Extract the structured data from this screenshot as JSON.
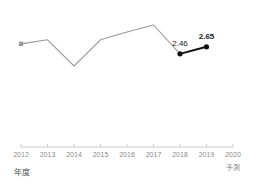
{
  "chart_data": {
    "type": "line",
    "title": "",
    "xlabel": "年度",
    "ylabel": "",
    "categories": [
      "2012",
      "2013",
      "2014",
      "2015",
      "2016",
      "2017",
      "2018",
      "2019",
      "2020"
    ],
    "series": [
      {
        "name": "actual",
        "color": "#9a9a9a",
        "values": [
          2.73,
          2.84,
          2.13,
          2.84,
          3.05,
          3.24,
          2.46,
          null,
          null
        ]
      },
      {
        "name": "highlight",
        "color": "#111111",
        "values": [
          null,
          null,
          null,
          null,
          null,
          null,
          2.46,
          2.65,
          null
        ]
      }
    ],
    "point_labels": [
      {
        "category": "2018",
        "text": "2.46",
        "emphasis": false
      },
      {
        "category": "2019",
        "text": "2.65",
        "emphasis": true
      }
    ],
    "markers": [
      {
        "category": "2012",
        "shape": "square",
        "color": "#9a9a9a"
      },
      {
        "category": "2018",
        "shape": "circle",
        "color": "#111111"
      },
      {
        "category": "2019",
        "shape": "circle",
        "color": "#111111"
      }
    ],
    "grid": false,
    "legend": null,
    "axis_line_color": "#cccccc",
    "tick_label_color": "#8a8a8a",
    "annotations": [
      {
        "text": "予測",
        "under_category": "2020"
      }
    ]
  },
  "axis": {
    "ticks": [
      {
        "label": "2012"
      },
      {
        "label": "2013"
      },
      {
        "label": "2014"
      },
      {
        "label": "2015"
      },
      {
        "label": "2016"
      },
      {
        "label": "2017"
      },
      {
        "label": "2018"
      },
      {
        "label": "2019"
      },
      {
        "label": "2020"
      }
    ],
    "caption": "年度",
    "forecast_note": "予測"
  },
  "labels": {
    "point_2018": "2.46",
    "point_2019": "2.65"
  },
  "colors": {
    "line_actual": "#9a9a9a",
    "line_highlight": "#111111",
    "axis": "#cccccc",
    "tick_text": "#8a8a8a",
    "label_text": "#1a1a1a",
    "caption_text": "#555555",
    "background": "#ffffff"
  }
}
